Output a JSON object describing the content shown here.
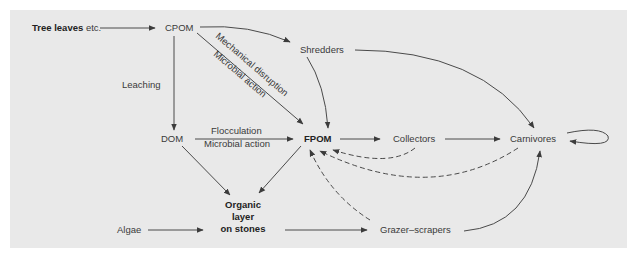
{
  "diagram": {
    "colors": {
      "panel_background": "#e9e9e9",
      "page_background": "#ffffff",
      "text": "#3a3a3a",
      "edge": "#4a4a4a"
    },
    "nodes": {
      "tree_leaves_bold": "Tree leaves",
      "tree_leaves_rest": " etc.",
      "cpom": "CPOM",
      "shredders": "Shredders",
      "dom": "DOM",
      "fpom": "FPOM",
      "collectors": "Collectors",
      "carnivores": "Carnivores",
      "organic_line1": "Organic",
      "organic_line2": "layer",
      "organic_line3": "on stones",
      "algae": "Algae",
      "grazer_scrapers": "Grazer–scrapers"
    },
    "edge_labels": {
      "leaching": "Leaching",
      "mechanical_disruption": "Mechanical disruption",
      "microbial_action_diag": "Microbial action",
      "flocculation": "Flocculation",
      "microbial_action_horiz": "Microbial action"
    },
    "edges": [
      {
        "from": "Tree leaves etc.",
        "to": "CPOM",
        "style": "solid"
      },
      {
        "from": "CPOM",
        "to": "Shredders",
        "style": "solid"
      },
      {
        "from": "CPOM",
        "to": "DOM",
        "label": "Leaching",
        "style": "solid"
      },
      {
        "from": "CPOM",
        "to": "FPOM",
        "label": "Mechanical disruption / Microbial action",
        "style": "solid"
      },
      {
        "from": "Shredders",
        "to": "FPOM",
        "style": "solid"
      },
      {
        "from": "Shredders",
        "to": "Carnivores",
        "style": "solid"
      },
      {
        "from": "DOM",
        "to": "FPOM",
        "label": "Flocculation / Microbial action",
        "style": "solid"
      },
      {
        "from": "DOM",
        "to": "Organic layer on stones",
        "style": "solid"
      },
      {
        "from": "FPOM",
        "to": "Organic layer on stones",
        "style": "solid"
      },
      {
        "from": "FPOM",
        "to": "Collectors",
        "style": "solid"
      },
      {
        "from": "Collectors",
        "to": "Carnivores",
        "style": "solid"
      },
      {
        "from": "Collectors",
        "to": "FPOM",
        "style": "dashed"
      },
      {
        "from": "Carnivores",
        "to": "FPOM",
        "style": "dashed"
      },
      {
        "from": "Grazer-scrapers",
        "to": "FPOM",
        "style": "dashed"
      },
      {
        "from": "Algae",
        "to": "Organic layer on stones",
        "style": "solid"
      },
      {
        "from": "Organic layer on stones",
        "to": "Grazer-scrapers",
        "style": "solid"
      },
      {
        "from": "Grazer-scrapers",
        "to": "Carnivores",
        "style": "solid"
      },
      {
        "from": "Carnivores",
        "to": "Carnivores",
        "style": "solid"
      }
    ]
  }
}
